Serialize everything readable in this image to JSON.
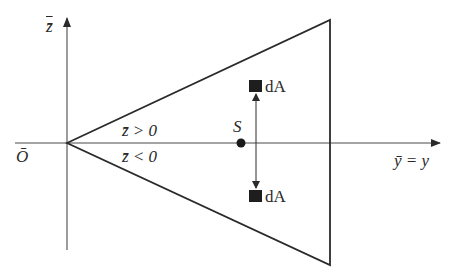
{
  "diagram": {
    "type": "cross-section geometry",
    "axes": {
      "vertical": {
        "label": "z̄"
      },
      "horizontal": {
        "label": "ȳ = y"
      },
      "origin": {
        "label": "Ō"
      }
    },
    "regions": {
      "upper": "z̄ > 0",
      "lower": "z̄ < 0"
    },
    "centroid": {
      "label": "S"
    },
    "elements": {
      "upper": {
        "label": "dA"
      },
      "lower": {
        "label": "dA"
      }
    },
    "shape": "triangle with apex at origin, vertical right edge",
    "colors": {
      "line": "#2a2a2a",
      "background": "#ffffff"
    }
  }
}
